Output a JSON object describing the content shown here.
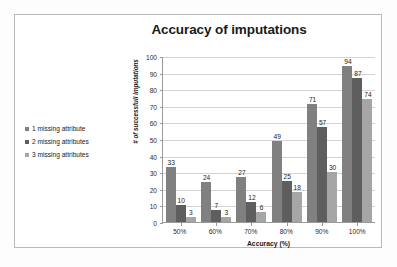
{
  "chart_data": {
    "type": "bar",
    "title": "Accuracy of imputations",
    "xlabel": "Accuracy  (%)",
    "ylabel": "# of successfull imputations",
    "categories": [
      "50%",
      "60%",
      "70%",
      "80%",
      "90%",
      "100%"
    ],
    "series": [
      {
        "name": "1 missing attribute",
        "values": [
          33,
          24,
          27,
          49,
          71,
          94
        ],
        "color": "#808080"
      },
      {
        "name": "2 missing attributes",
        "values": [
          10,
          7,
          12,
          25,
          57,
          87
        ],
        "color": "#5e5e5e"
      },
      {
        "name": "3 missing attributes",
        "values": [
          3,
          3,
          6,
          18,
          30,
          74
        ],
        "color": "#a6a6a6"
      }
    ],
    "ylim": [
      0,
      100
    ],
    "yticks": [
      0,
      10,
      20,
      30,
      40,
      50,
      60,
      70,
      80,
      90,
      100
    ],
    "grid": true,
    "legend_position": "left",
    "data_labels": true
  },
  "figure": {
    "border_color": "#b9b9b9",
    "background": "#ffffff"
  }
}
